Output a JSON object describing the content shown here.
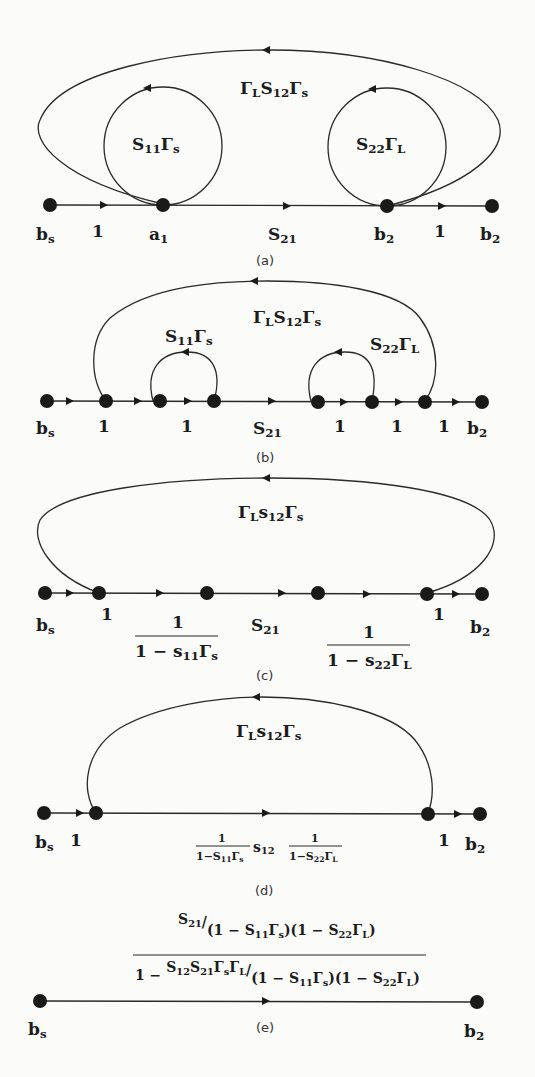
{
  "figure": {
    "panels": [
      {
        "id": "a",
        "caption": "(a)",
        "nodes": [
          "b_s",
          "a_1",
          "b_2",
          "b_2"
        ],
        "node_labels": {
          "bs": "b",
          "bs_sub": "s",
          "a1": "a",
          "a1_sub": "1",
          "b2a": "b",
          "b2a_sub": "2",
          "b2b": "b",
          "b2b_sub": "2"
        },
        "branch_labels": {
          "one_left": "1",
          "s21": "S",
          "s21_sub": "21",
          "one_right": "1"
        },
        "loops": {
          "outer": {
            "g1": "Γ",
            "g1_sub": "L",
            "s": "S",
            "s_sub": "12",
            "g2": "Γ",
            "g2_sub": "s"
          },
          "left": {
            "s": "S",
            "s_sub": "11",
            "g": "Γ",
            "g_sub": "s"
          },
          "right": {
            "s": "S",
            "s_sub": "22",
            "g": "Γ",
            "g_sub": "L"
          }
        }
      },
      {
        "id": "b",
        "caption": "(b)",
        "branch_labels": {
          "bs": "b",
          "bs_sub": "s",
          "one1": "1",
          "one2": "1",
          "s21": "S",
          "s21_sub": "21",
          "one3": "1",
          "one4": "1",
          "one5": "1",
          "b2": "b",
          "b2_sub": "2"
        },
        "loops": {
          "outer": {
            "g1": "Γ",
            "g1_sub": "L",
            "s": "S",
            "s_sub": "12",
            "g2": "Γ",
            "g2_sub": "s"
          },
          "left": {
            "s": "S",
            "s_sub": "11",
            "g": "Γ",
            "g_sub": "s"
          },
          "right": {
            "s": "S",
            "s_sub": "22",
            "g": "Γ",
            "g_sub": "L"
          }
        }
      },
      {
        "id": "c",
        "caption": "(c)",
        "branch_labels": {
          "bs": "b",
          "bs_sub": "s",
          "one1": "1",
          "s21": "S",
          "s21_sub": "21",
          "one2": "1",
          "b2": "b",
          "b2_sub": "2"
        },
        "fractions": {
          "left": {
            "num": "1",
            "den_pre": "1 − s",
            "den_sub": "11",
            "den_g": "Γ",
            "den_g_sub": "s"
          },
          "right": {
            "num": "1",
            "den_pre": "1 − s",
            "den_sub": "22",
            "den_g": "Γ",
            "den_g_sub": "L"
          }
        },
        "loops": {
          "outer": {
            "g1": "Γ",
            "g1_sub": "L",
            "s": "s",
            "s_sub": "12",
            "g2": "Γ",
            "g2_sub": "s"
          }
        }
      },
      {
        "id": "d",
        "caption": "(d)",
        "branch_labels": {
          "bs": "b",
          "bs_sub": "s",
          "one1": "1",
          "one2": "1",
          "b2": "b",
          "b2_sub": "2"
        },
        "path_gain": {
          "f1_num": "1",
          "f1_den": "1−S",
          "f1_den_sub": "11",
          "f1_g": "Γ",
          "f1_g_sub": "s",
          "mid": "s",
          "mid_sub": "12",
          "f2_num": "1",
          "f2_den": "1−S",
          "f2_den_sub": "22",
          "f2_g": "Γ",
          "f2_g_sub": "L"
        },
        "loops": {
          "outer": {
            "g1": "Γ",
            "g1_sub": "L",
            "s": "s",
            "s_sub": "12",
            "g2": "Γ",
            "g2_sub": "s"
          }
        }
      },
      {
        "id": "e",
        "caption": "(e)",
        "branch_labels": {
          "bs": "b",
          "bs_sub": "s",
          "b2": "b",
          "b2_sub": "2"
        },
        "overall_gain": {
          "num_s": "S",
          "num_s_sub": "21",
          "slash": "/",
          "num_den": "(1 − S",
          "num_den_sub1": "11",
          "num_den_g1": "Γ",
          "num_den_g1_sub": "s",
          "num_den_mid": ")(1 − S",
          "num_den_sub2": "22",
          "num_den_g2": "Γ",
          "num_den_g2_sub": "L",
          "num_den_end": ")",
          "den_pre": "1 − ",
          "den_s12": "S",
          "den_s12_sub": "12",
          "den_s21": "S",
          "den_s21_sub": "21",
          "den_g1": "Γ",
          "den_g1_sub": "s",
          "den_g2": "Γ",
          "den_g2_sub": "L",
          "den_den": "(1 − S",
          "den_den_sub1": "11",
          "den_den_g1": "Γ",
          "den_den_g1_sub": "s",
          "den_den_mid": ")(1 − S",
          "den_den_sub2": "22",
          "den_den_g2": "Γ",
          "den_den_g2_sub": "L",
          "den_den_end": ")"
        }
      }
    ]
  },
  "colors": {
    "ink": "#1a1a1a",
    "paper": "#fbfbfa"
  }
}
